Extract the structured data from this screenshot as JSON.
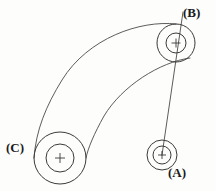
{
  "diagram": {
    "type": "engineering-line-drawing",
    "canvas": {
      "width": 216,
      "height": 191
    },
    "background_color": "#fdfdfc",
    "stroke_color": "#3a3a3a",
    "label_color": "#1a1a1a",
    "labels": [
      {
        "id": "A",
        "text": "(A)",
        "x": 168,
        "y": 166
      },
      {
        "id": "B",
        "text": "(B)",
        "x": 183,
        "y": 6
      },
      {
        "id": "C",
        "text": "(C)",
        "x": 6,
        "y": 141
      }
    ],
    "pulleys": [
      {
        "id": "A",
        "label": "(A)",
        "center_x": 162,
        "center_y": 155,
        "outer_radius": 15,
        "inner_radius": 9,
        "crosshair_size": 8
      },
      {
        "id": "B",
        "label": "(B)",
        "center_x": 176,
        "center_y": 43,
        "outer_radius": 19,
        "inner_radius": 10,
        "crosshair_size": 9
      },
      {
        "id": "C",
        "label": "(C)",
        "center_x": 60,
        "center_y": 158,
        "outer_radius": 26,
        "inner_radius": 14,
        "crosshair_size": 10
      }
    ],
    "belt": {
      "description": "Wide band wrapping from pulley B around to pulley C",
      "outer_path": "M 176 24 C 140 20, 88 38, 62 80 C 46 106, 36 130, 34 158",
      "inner_path": "M 190 58 C 160 62, 122 86, 104 116 C 94 134, 88 148, 86 158"
    },
    "shaft_line": {
      "description": "Straight centre line from above pulley B through B down to pulley A",
      "x1": 183,
      "y1": 12,
      "x2": 162,
      "y2": 155
    }
  }
}
